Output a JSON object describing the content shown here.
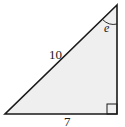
{
  "diagram": {
    "type": "right-triangle",
    "fill_color": "#efefef",
    "stroke_color": "#1a1a1a",
    "vertices": {
      "top": [
        117,
        5
      ],
      "bottom_left": [
        5,
        114
      ],
      "bottom_right": [
        117,
        114
      ]
    },
    "labels": {
      "hypotenuse": "10",
      "base": "7",
      "angle": "e"
    },
    "right_angle_marker": true
  }
}
